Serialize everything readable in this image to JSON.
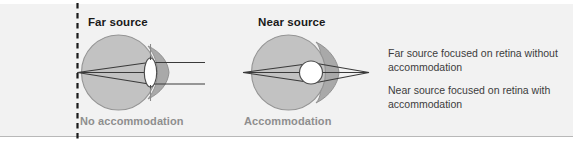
{
  "figure": {
    "background_color": "#f2f2f2",
    "border_color": "#b8b8b8"
  },
  "panels": [
    {
      "id": "far",
      "title": "Far source",
      "caption": "No accommodation",
      "lens_state": "flat",
      "source_position": "left-on-dashed-line",
      "ray_exit": "parallel"
    },
    {
      "id": "near",
      "title": "Near source",
      "caption": "Accommodation",
      "lens_state": "round",
      "source_position": "right-point",
      "ray_exit": "converging"
    }
  ],
  "notes": [
    "Far source focused on retina without accommodation",
    "Near source focused on retina with accommodation"
  ],
  "colors": {
    "eye_fill": "#bfbfbf",
    "eye_stroke": "#8f8f8f",
    "cornea_fill": "#a8a8a8",
    "lens_fill": "#ffffff",
    "lens_stroke": "#555555",
    "ray_stroke": "#3a3a3a",
    "dashed_line": "#1a1a1a",
    "title_text": "#1a1a1a",
    "caption_text": "#8e8e8e",
    "note_text": "#3c3c3c"
  },
  "icons": {
    "dashed_axis": "dashed-vertical-line-icon",
    "eye_globe": "eye-globe-icon",
    "lens_flat": "lens-flat-icon",
    "lens_round": "lens-round-icon"
  }
}
